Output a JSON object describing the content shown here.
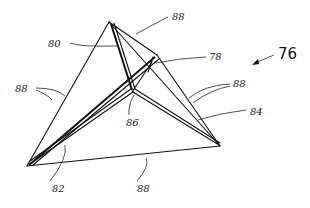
{
  "figure": {
    "number": "76",
    "labels": [
      {
        "id": "label-80",
        "text": "80",
        "x": 48,
        "y": 47
      },
      {
        "id": "label-88-top",
        "text": "88",
        "x": 172,
        "y": 20
      },
      {
        "id": "label-78",
        "text": "78",
        "x": 209,
        "y": 60
      },
      {
        "id": "label-76",
        "text": "76",
        "x": 278,
        "y": 59
      },
      {
        "id": "label-88-left",
        "text": "88",
        "x": 15,
        "y": 92
      },
      {
        "id": "label-88-right",
        "text": "88",
        "x": 233,
        "y": 87
      },
      {
        "id": "label-86",
        "text": "86",
        "x": 126,
        "y": 126
      },
      {
        "id": "label-84",
        "text": "84",
        "x": 250,
        "y": 115
      },
      {
        "id": "label-82",
        "text": "82",
        "x": 52,
        "y": 192
      },
      {
        "id": "label-88-bottom",
        "text": "88",
        "x": 137,
        "y": 192
      }
    ]
  }
}
